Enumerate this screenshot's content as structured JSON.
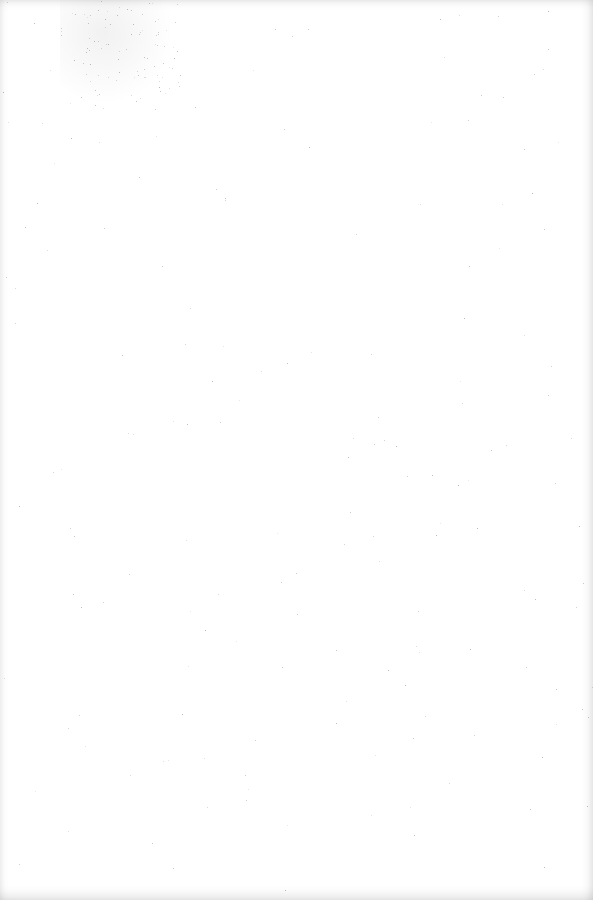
{
  "document": {
    "type": "blank-scanned-page",
    "text": "",
    "background_color": "#ffffff",
    "noise_color": "#9a9a9a"
  }
}
